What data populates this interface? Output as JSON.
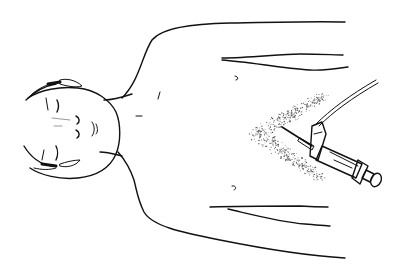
{
  "figure": {
    "type": "medical-line-illustration",
    "colors": {
      "background": "#ffffff",
      "ink": "#111111",
      "stipple": "#555555"
    },
    "elements": [
      {
        "name": "head",
        "description": "face with closed eyes, viewed from above, rotated"
      },
      {
        "name": "torso-outline",
        "description": "shoulders and arms outline"
      },
      {
        "name": "stippled-area",
        "description": "shaded V region at xiphoid"
      },
      {
        "name": "syringe",
        "description": "syringe with needle and attached wire/tubing"
      }
    ]
  }
}
